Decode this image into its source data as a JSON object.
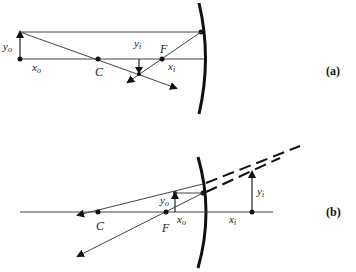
{
  "diagram_a": {
    "tag": "(a)",
    "labels": {
      "yo": "y",
      "yo_sub": "o",
      "xo": "x",
      "xo_sub": "o",
      "yi": "y",
      "yi_sub": "i",
      "xi": "x",
      "xi_sub": "i",
      "C": "C",
      "F": "F"
    }
  },
  "diagram_b": {
    "tag": "(b)",
    "labels": {
      "yo": "y",
      "yo_sub": "o",
      "xo": "x",
      "xo_sub": "o",
      "yi": "y",
      "yi_sub": "i",
      "xi": "x",
      "xi_sub": "i",
      "C": "C",
      "F": "F"
    }
  },
  "colors": {
    "line": "#333333",
    "mirror": "#111111"
  }
}
